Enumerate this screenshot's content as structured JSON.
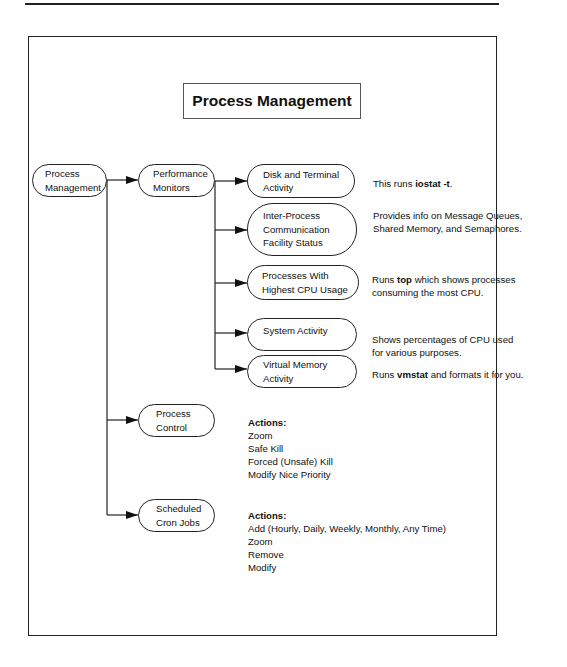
{
  "title": "Process Management",
  "root": {
    "lines": [
      "Process",
      "Management"
    ]
  },
  "level1": [
    {
      "id": "performance-monitors",
      "lines": [
        "Performance",
        "Monitors"
      ]
    },
    {
      "id": "process-control",
      "lines": [
        "Process",
        "Control"
      ]
    },
    {
      "id": "scheduled-cron-jobs",
      "lines": [
        "Scheduled",
        "Cron Jobs"
      ]
    }
  ],
  "monitors": [
    {
      "lines": [
        "Disk and Terminal",
        "Activity"
      ],
      "desc": {
        "pre": "This runs ",
        "bold": "iostat -t",
        "post": "."
      }
    },
    {
      "lines": [
        "Inter-Process",
        "Communication",
        "Facility Status"
      ],
      "desc": {
        "line1": "Provides info on Message Queues,",
        "line2": "Shared Memory, and Semaphores."
      }
    },
    {
      "lines": [
        "Processes With",
        "Highest CPU Usage"
      ],
      "desc": {
        "pre": "Runs ",
        "bold": "top",
        "post": " which shows processes",
        "line2": "consuming the most CPU."
      }
    },
    {
      "lines": [
        "System Activity"
      ],
      "desc": {
        "line1": "Shows percentages of CPU used",
        "line2": "for various purposes."
      }
    },
    {
      "lines": [
        "Virtual Memory",
        "Activity"
      ],
      "desc": {
        "pre": "Runs ",
        "bold": "vmstat",
        "post": " and formats it for you."
      }
    }
  ],
  "process_control_actions": {
    "header": "Actions:",
    "items": [
      "Zoom",
      "Safe Kill",
      "Forced (Unsafe) Kill",
      "Modify Nice Priority"
    ]
  },
  "cron_actions": {
    "header": "Actions:",
    "items": [
      "Add (Hourly, Daily, Weekly, Monthly, Any Time)",
      "Zoom",
      "Remove",
      "Modify"
    ]
  },
  "colors": {
    "line": "#222222",
    "background": "#ffffff"
  }
}
